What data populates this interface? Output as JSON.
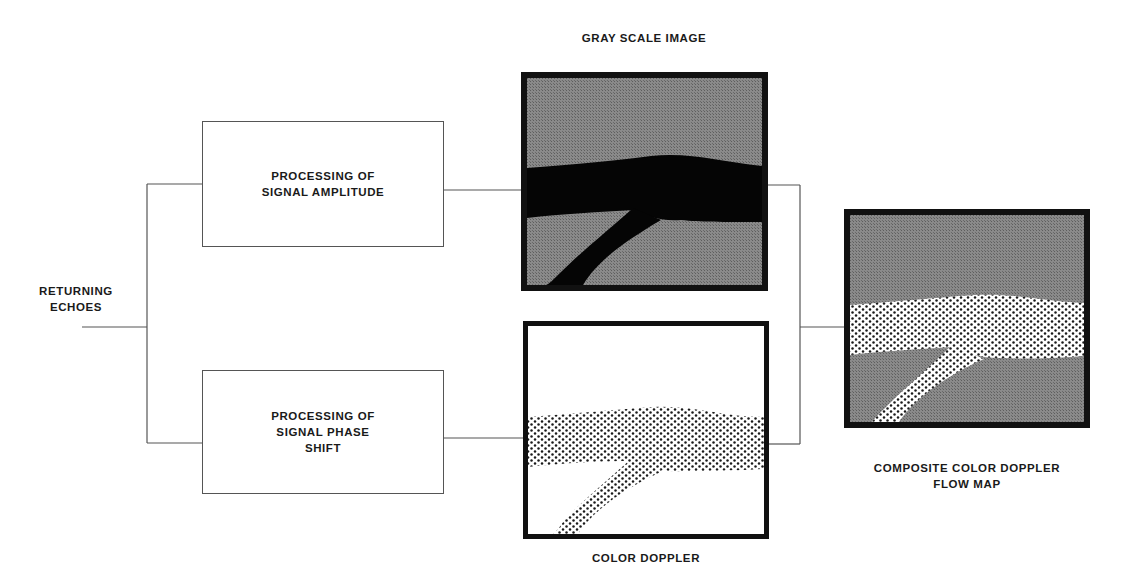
{
  "input": {
    "label_lines": [
      "RETURNING",
      "ECHOES"
    ]
  },
  "processing": {
    "amplitude": {
      "label_lines": [
        "PROCESSING OF",
        "SIGNAL AMPLITUDE"
      ]
    },
    "phase_shift": {
      "label_lines": [
        "PROCESSING OF",
        "SIGNAL PHASE",
        "SHIFT"
      ]
    }
  },
  "outputs": {
    "gray_scale": {
      "title": "GRAY SCALE IMAGE"
    },
    "color_doppler": {
      "title": "COLOR DOPPLER"
    },
    "composite": {
      "title_lines": [
        "COMPOSITE COLOR DOPPLER",
        "FLOW MAP"
      ]
    }
  },
  "colors": {
    "line": "#555555",
    "frame": "#111111",
    "tissue_gray": "#7a7a7a",
    "vessel_black": "#050505",
    "dot": "#1a1a1a"
  }
}
